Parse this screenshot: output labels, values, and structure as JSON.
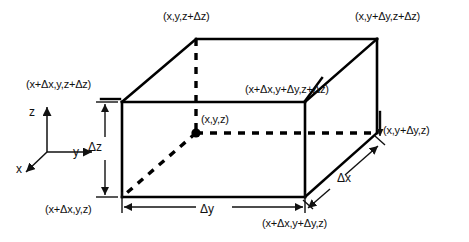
{
  "figure": {
    "stroke_color": "#000000",
    "background_color": "#ffffff"
  },
  "vertices": {
    "top_back_left": "(x,y,z+Δz)",
    "top_back_right": "(x,y+Δy,z+Δz)",
    "top_front_left": "(x+Δx,y,z+Δz)",
    "top_front_right": "(x+Δx,y+Δy,z+Δz)",
    "center_point": "(x,y,z)",
    "bottom_back_right": "(x,y+Δy,z)",
    "bottom_front_left": "(x+Δx,y,z)",
    "bottom_front_right": "(x+Δx,y+Δy,z)"
  },
  "axes": {
    "z_label": "z",
    "y_label": "y",
    "x_label": "x"
  },
  "dimensions": {
    "height": "Δz",
    "width": "Δy",
    "depth": "Δx"
  }
}
